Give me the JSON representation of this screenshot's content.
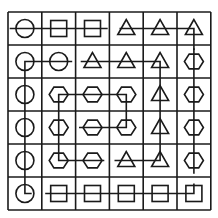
{
  "puzzle": {
    "rows": 6,
    "cols": 6,
    "colors": {
      "ink": "#1a1a1a",
      "background": "#ffffff"
    },
    "grid": [
      [
        "circle",
        "square",
        "square",
        "triangle",
        "triangle",
        "triangle"
      ],
      [
        "circle",
        "circle",
        "triangle",
        "triangle",
        "triangle",
        "hexagon"
      ],
      [
        "circle",
        "hexagon",
        "hexagon",
        "hexagon",
        "triangle",
        "hexagon"
      ],
      [
        "circle",
        "hexagon",
        "hexagon",
        "hexagon",
        "triangle",
        "hexagon"
      ],
      [
        "circle",
        "hexagon",
        "hexagon",
        "triangle",
        "triangle",
        "hexagon"
      ],
      [
        "circle",
        "square",
        "square",
        "square",
        "square",
        "square"
      ]
    ],
    "paths": [
      {
        "name": "row0-left",
        "points": [
          [
            0,
            -0.45
          ],
          [
            0,
            0
          ],
          [
            0,
            1
          ],
          [
            0,
            2
          ],
          [
            0,
            2.45
          ]
        ]
      },
      {
        "name": "row0-right-triangles",
        "points": [
          [
            0,
            2.8
          ],
          [
            0,
            3
          ],
          [
            0,
            4
          ],
          [
            0,
            5
          ],
          [
            0,
            5
          ],
          [
            0.65,
            5
          ]
        ]
      },
      {
        "name": "circle-chain-to-squares",
        "points": [
          [
            1,
            1.4
          ],
          [
            1,
            1
          ],
          [
            1,
            0
          ],
          [
            5,
            0
          ],
          [
            5,
            0.2
          ]
        ]
      },
      {
        "name": "square-bottom-row",
        "points": [
          [
            5,
            0.6
          ],
          [
            5,
            5
          ],
          [
            4.7,
            5
          ]
        ]
      },
      {
        "name": "triangle-chain",
        "points": [
          [
            1,
            1.65
          ],
          [
            1,
            4
          ],
          [
            4,
            4
          ],
          [
            4,
            2.65
          ]
        ]
      },
      {
        "name": "hexagon-right-column",
        "points": [
          [
            0.6,
            5
          ],
          [
            4.4,
            5
          ]
        ]
      },
      {
        "name": "hexagon-spiral",
        "points": [
          [
            3,
            1.6
          ],
          [
            3,
            3
          ],
          [
            2,
            3
          ],
          [
            2,
            1
          ],
          [
            4,
            1
          ],
          [
            4,
            2.35
          ]
        ]
      }
    ]
  }
}
